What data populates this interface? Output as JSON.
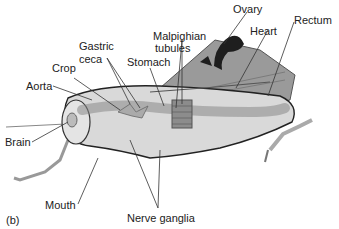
{
  "figure": {
    "panel_label": "(b)"
  },
  "labels": {
    "ovary": "Ovary",
    "heart": "Heart",
    "rectum": "Rectum",
    "malpighian_1": "Malpighian",
    "malpighian_2": "tubules",
    "gastric_1": "Gastric",
    "gastric_2": "ceca",
    "stomach": "Stomach",
    "crop": "Crop",
    "aorta": "Aorta",
    "brain": "Brain",
    "mouth": "Mouth",
    "nerve_ganglia": "Nerve ganglia"
  },
  "colors": {
    "body_fill": "#d9d9d9",
    "body_dark": "#6e6e6e",
    "wing_fill": "#8a8a8a",
    "ovary_fill": "#1e1e1e",
    "leader_line": "#333333"
  }
}
